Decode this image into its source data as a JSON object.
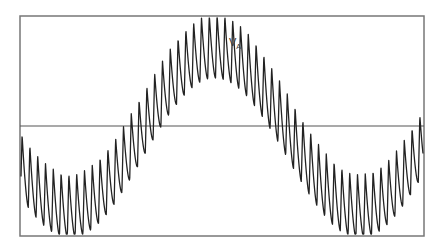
{
  "chart_data": {
    "type": "line",
    "title": "",
    "xlabel": "",
    "ylabel": "",
    "grid": false,
    "annotations": [
      {
        "text": "V",
        "subscript": "A",
        "x": 228,
        "y": 45
      }
    ],
    "series": [
      {
        "name": "V_A",
        "description": "Sinusoidal fundamental with high-frequency sawtooth ripple (PWM-like phase voltage)",
        "fundamental": {
          "period_px": 290,
          "phase_max_x": 215,
          "amplitude_px": 80,
          "offset_y": 126
        },
        "ripple": {
          "period_px": 7.8,
          "amplitude_px": 64,
          "rise_fraction": 0.2
        }
      }
    ],
    "frame": {
      "left": 20,
      "top": 16,
      "right": 424,
      "bottom": 236
    },
    "zero_line_y": 126,
    "colors": {
      "frame": "#777777",
      "trace": "#222222",
      "axis": "#555555"
    }
  },
  "label": {
    "main": "V",
    "sub": "A"
  }
}
